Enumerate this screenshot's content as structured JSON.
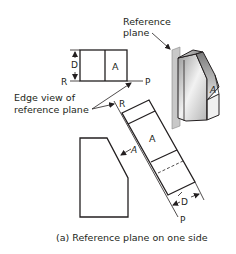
{
  "figure": {
    "caption": "(a) Reference plane on one side",
    "colors": {
      "line": "#231f20",
      "background": "#ffffff",
      "plane": "#c8c8c8"
    }
  },
  "labels": {
    "reference_plane": [
      "Reference",
      "plane"
    ],
    "edge_view": [
      "Edge view of",
      "reference plane"
    ],
    "top_view": {
      "face": "A",
      "depth": "D",
      "ref_left": "R",
      "ref_right": "P"
    },
    "aux_view": {
      "face": "A",
      "depth": "D",
      "ref_top": "R",
      "ref_bottom": "P"
    },
    "front_view": {
      "face": "A"
    },
    "pictorial": {
      "face": "A"
    }
  }
}
